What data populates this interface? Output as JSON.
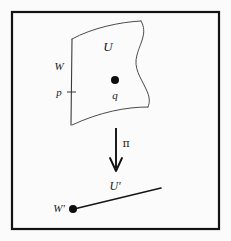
{
  "figure": {
    "background_color": "#fbfbfb",
    "frame_color": "#121212",
    "ink_color": "#2b2b2b"
  },
  "labels": {
    "total_space_patch": "U",
    "fiber_line": "W",
    "fiber_point": "p",
    "interior_point": "q",
    "projection_map": "π",
    "base_patch": "U'",
    "base_point": "W'"
  },
  "elements": {
    "patch": {
      "name": "curved-surface-patch",
      "description": "quadrilateral patch with wavy right boundary"
    },
    "arrow": {
      "name": "projection-arrow",
      "direction": "down"
    },
    "base": {
      "name": "base-space-line",
      "description": "straight segment rising to the right"
    }
  },
  "points": {
    "q_dot_radius": 4,
    "w_prime_dot_radius": 4
  }
}
